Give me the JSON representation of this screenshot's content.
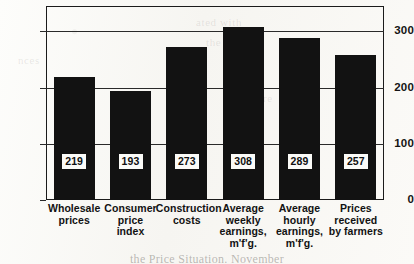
{
  "chart_data": {
    "type": "bar",
    "title": "",
    "subtitle": "",
    "xlabel": "",
    "ylabel": "",
    "ylim": [
      0,
      345
    ],
    "grid": true,
    "legend": "none",
    "orientation": "vertical",
    "bar_color": "#121212",
    "background_color": "#fbfaf7",
    "axis_color": "#1b1b1b",
    "yticks": [
      0,
      100,
      200,
      300
    ],
    "ytick_labels": [
      "0",
      "100",
      "200",
      "300"
    ],
    "categories": [
      "Wholesale prices",
      "Consumer price index",
      "Construction costs",
      "Average weekly earnings, m'f'g.",
      "Average hourly earnings, m'f'g.",
      "Prices received by farmers"
    ],
    "category_lines": [
      [
        "Wholesale",
        "prices"
      ],
      [
        "Consumer",
        "price",
        "index"
      ],
      [
        "Construction",
        "costs"
      ],
      [
        "Average",
        "weekly",
        "earnings,",
        "m'f'g."
      ],
      [
        "Average",
        "hourly",
        "earnings,",
        "m'f'g."
      ],
      [
        "Prices",
        "received",
        "by farmers"
      ]
    ],
    "values": [
      219,
      193,
      273,
      308,
      289,
      257
    ],
    "value_labels": [
      "219",
      "193",
      "273",
      "308",
      "289",
      "257"
    ]
  },
  "ghost_text": {
    "line_a": "ated with",
    "line_b": "the same",
    "line_c": "nces",
    "line_d": "measure"
  },
  "bottom_caption": {
    "text": "the Price Situation. November"
  }
}
